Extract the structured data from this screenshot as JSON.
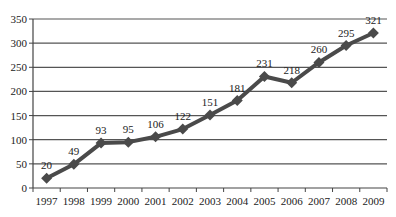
{
  "chart_data": {
    "type": "line",
    "title": "",
    "xlabel": "",
    "ylabel": "",
    "categories": [
      "1997",
      "1998",
      "1999",
      "2000",
      "2001",
      "2002",
      "2003",
      "2004",
      "2005",
      "2006",
      "2007",
      "2008",
      "2009"
    ],
    "series": [
      {
        "name": "",
        "values": [
          20,
          49,
          93,
          95,
          106,
          122,
          151,
          181,
          231,
          218,
          260,
          295,
          321
        ]
      }
    ],
    "ylim": [
      0,
      350
    ],
    "yticks": [
      0,
      50,
      100,
      150,
      200,
      250,
      300,
      350
    ],
    "grid": true,
    "legend": "none",
    "data_labels": true,
    "marker": "diamond",
    "colors": {
      "line": "#4a4a4a",
      "grid": "#555555",
      "axis": "#444444",
      "text": "#222222"
    }
  }
}
